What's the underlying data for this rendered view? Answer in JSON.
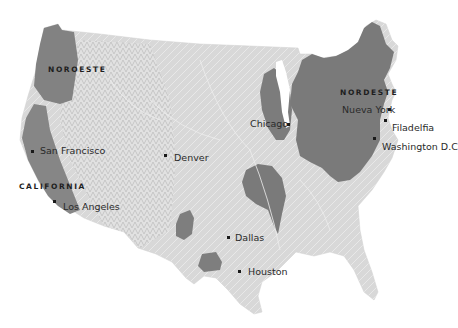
{
  "map": {
    "type": "shaded-relief choropleth",
    "colors": {
      "background": "#ffffff",
      "land_base": "#d6d6d6",
      "land_light": "#e6e6e6",
      "mountains": "#c4c4c4",
      "highlighted_region": "#7a7a7a",
      "highlighted_region_edge": "#6a6a6a",
      "water_lines": "#f2f2f2",
      "text": "#2a2a2a"
    },
    "regions": [
      {
        "label": "NOROESTE"
      },
      {
        "label": "CALIFORNIA"
      },
      {
        "label": "NORDESTE"
      }
    ],
    "cities": [
      {
        "label": "San Francisco"
      },
      {
        "label": "Los Angeles"
      },
      {
        "label": "Denver"
      },
      {
        "label": "Chicago"
      },
      {
        "label": "Nueva York"
      },
      {
        "label": "Filadelfia"
      },
      {
        "label": "Washington D.C"
      },
      {
        "label": "Dallas"
      },
      {
        "label": "Houston"
      }
    ]
  }
}
